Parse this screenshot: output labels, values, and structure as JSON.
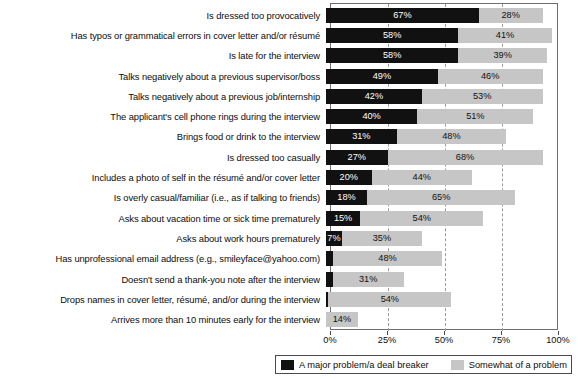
{
  "chart_data": {
    "type": "bar",
    "orientation": "horizontal",
    "stacked": true,
    "title": "",
    "subtitle": "",
    "xlabel": "",
    "ylabel": "",
    "xlim": [
      0,
      100
    ],
    "xticks": [
      "0%",
      "25%",
      "50%",
      "75%",
      "100%"
    ],
    "xtick_values": [
      0,
      25,
      50,
      75,
      100
    ],
    "grid": "vertical-dashed",
    "legend_position": "bottom",
    "categories": [
      "Is dressed too provocatively",
      "Has typos or grammatical errors in cover letter and/or résumé",
      "Is late for the interview",
      "Talks negatively about a previous supervisor/boss",
      "Talks negatively about a previous job/internship",
      "The applicant's cell phone rings during the interview",
      "Brings food or drink to the interview",
      "Is dressed too casually",
      "Includes a photo of self in the résumé and/or cover letter",
      "Is overly casual/familiar (i.e., as if talking to friends)",
      "Asks about vacation time or sick time prematurely",
      "Asks about work hours prematurely",
      "Has unprofessional email address (e.g., smileyface@yahoo.com)",
      "Doesn't send a thank-you note after the interview",
      "Drops names in cover letter, résumé, and/or during the interview",
      "Arrives more than 10 minutes early for the interview"
    ],
    "series": [
      {
        "name": "A major problem/a deal breaker",
        "color": "#111111",
        "values": [
          67,
          58,
          58,
          49,
          42,
          40,
          31,
          27,
          20,
          18,
          15,
          7,
          3,
          3,
          1,
          0
        ],
        "labels": [
          "67%",
          "58%",
          "58%",
          "49%",
          "42%",
          "40%",
          "31%",
          "27%",
          "20%",
          "18%",
          "15%",
          "7%",
          "",
          "",
          "",
          ""
        ]
      },
      {
        "name": "Somewhat of a problem",
        "color": "#c6c6c6",
        "values": [
          28,
          41,
          39,
          46,
          53,
          51,
          48,
          68,
          44,
          65,
          54,
          35,
          48,
          31,
          54,
          14
        ],
        "labels": [
          "28%",
          "41%",
          "39%",
          "46%",
          "53%",
          "51%",
          "48%",
          "68%",
          "44%",
          "65%",
          "54%",
          "35%",
          "48%",
          "31%",
          "54%",
          "14%"
        ]
      }
    ]
  },
  "legend": {
    "items": [
      {
        "label": "A major problem/a deal breaker",
        "color": "#111111"
      },
      {
        "label": "Somewhat of a problem",
        "color": "#c6c6c6"
      }
    ]
  }
}
